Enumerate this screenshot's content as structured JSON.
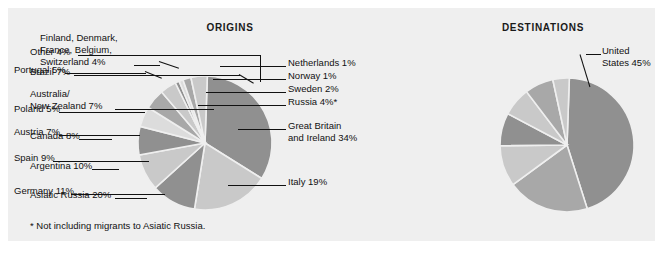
{
  "figure": {
    "background_color": "#efefef",
    "page_background": "#ffffff",
    "footnote": "* Not including migrants to Asiatic Russia."
  },
  "palette": {
    "dark_gray": "#909090",
    "mid_gray": "#a8a8a8",
    "light_gray": "#c9c9c9",
    "pale_gray": "#dcdcdc",
    "separator": "#efefef",
    "text": "#111111"
  },
  "chart_data": [
    {
      "type": "pie",
      "title": "ORIGINS",
      "units": "percent",
      "categories": [
        "Great Britain and Ireland",
        "Italy",
        "Germany",
        "Spain",
        "Austria",
        "Poland",
        "Portugal",
        "Finland, Denmark, France, Belgium, Switzerland",
        "Netherlands",
        "Norway",
        "Sweden",
        "Russia"
      ],
      "values": [
        34,
        19,
        11,
        9,
        7,
        5,
        5,
        4,
        1,
        1,
        2,
        4
      ],
      "labels": [
        "Great Britain and Ireland  34%",
        "Italy  19%",
        "Germany  11%",
        "Spain  9%",
        "Austria  7%",
        "Poland  5%",
        "Portugal  5%",
        "Finland, Denmark, France, Belgium, Switzerland  4%",
        "Netherlands  1%",
        "Norway  1%",
        "Sweden  2%",
        "Russia  4%*"
      ],
      "legend_position": "callout-labels",
      "grid": false
    },
    {
      "type": "pie",
      "title": "DESTINATIONS",
      "units": "percent",
      "categories": [
        "United States",
        "Asiatic Russia",
        "Argentina",
        "Canada",
        "Australia/New Zealand",
        "Brazil",
        "Other"
      ],
      "values": [
        45,
        20,
        10,
        8,
        7,
        7,
        4
      ],
      "labels": [
        "United States 45%",
        "Asiatic Russia  20%",
        "Argentina  10%",
        "Canada  8%",
        "Australia/ New Zealand  7%",
        "Brazil  7%",
        "Other  4%"
      ],
      "legend_position": "callout-labels",
      "grid": false
    }
  ],
  "origins": {
    "title": "ORIGINS",
    "labels": {
      "finland_group_l1": "Finland, Denmark,",
      "finland_group_l2": "France, Belgium,",
      "finland_group_l3": "Switzerland  4%",
      "portugal": "Portugal 5%",
      "poland": "Poland 5%",
      "austria": "Austria 7%",
      "spain": "Spain 9%",
      "germany": "Germany 11%",
      "netherlands": "Netherlands 1%",
      "norway": "Norway 1%",
      "sweden": "Sweden 2%",
      "russia": "Russia 4%*",
      "great_britain_l1": "Great Britain",
      "great_britain_l2": "and Ireland 34%",
      "italy": "Italy 19%"
    }
  },
  "destinations": {
    "title": "DESTINATIONS",
    "labels": {
      "other": "Other 4%",
      "brazil": "Brazil 7%",
      "australia_l1": "Australia/",
      "australia_l2": "New Zealand 7%",
      "canada": "Canada 8%",
      "argentina": "Argentina 10%",
      "asiatic_russia": "Asiatic Russia 20%",
      "united_states_l1": "United",
      "united_states_l2": "States 45%"
    }
  }
}
